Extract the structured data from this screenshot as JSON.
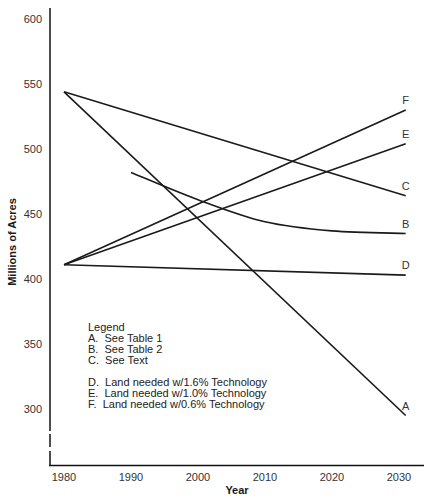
{
  "chart_data": {
    "type": "line",
    "title": "",
    "xlabel": "Year",
    "ylabel": "Millions of Acres",
    "xlim": [
      1978,
      2032
    ],
    "ylim": [
      260,
      610
    ],
    "x_ticks": [
      1980,
      1990,
      2000,
      2010,
      2020,
      2030
    ],
    "y_ticks": [
      300,
      350,
      400,
      450,
      500,
      550,
      600
    ],
    "grid": false,
    "y_axis_break": true,
    "series": [
      {
        "name": "A",
        "description": "See Table 1",
        "x": [
          1980,
          2031
        ],
        "values": [
          544,
          295
        ]
      },
      {
        "name": "B",
        "description": "See Table 2",
        "x": [
          1990,
          2000,
          2010,
          2020,
          2031
        ],
        "values": [
          482,
          461,
          444,
          437,
          435
        ]
      },
      {
        "name": "C",
        "description": "See Text",
        "x": [
          1980,
          2031
        ],
        "values": [
          544,
          464
        ]
      },
      {
        "name": "D",
        "description": "Land needed w/1.6% Technology",
        "x": [
          1980,
          2031
        ],
        "values": [
          411,
          403
        ]
      },
      {
        "name": "E",
        "description": "Land needed w/1.0% Technology",
        "x": [
          1980,
          2031
        ],
        "values": [
          411,
          504
        ]
      },
      {
        "name": "F",
        "description": "Land needed w/0.6% Technology",
        "x": [
          1980,
          2031
        ],
        "values": [
          411,
          530
        ]
      }
    ],
    "legend": {
      "title": "Legend",
      "position": "inside-lower-left",
      "entries": [
        "A.  See Table 1",
        "B.  See Table 2",
        "C.  See Text",
        "D.  Land needed w/1.6% Technology",
        "E.  Land needed w/1.0% Technology",
        "F.  Land needed w/0.6% Technology"
      ]
    }
  }
}
